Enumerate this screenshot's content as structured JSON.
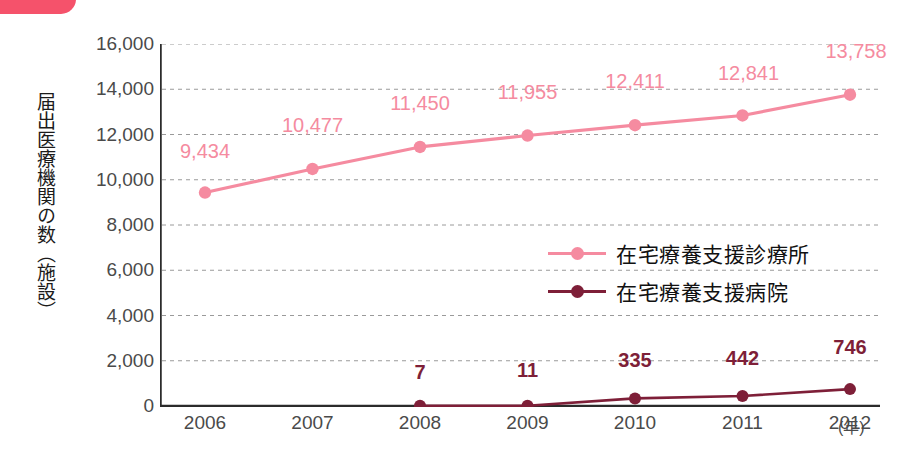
{
  "decoration": {
    "corner_tab_color": "#f5526b"
  },
  "axis": {
    "y_title": "届出医療機関の数（施設）",
    "x_unit": "(年)",
    "y_ticks": [
      "16,000",
      "14,000",
      "12,000",
      "10,000",
      "8,000",
      "6,000",
      "4,000",
      "2,000",
      "0"
    ],
    "x_ticks": [
      "2006",
      "2007",
      "2008",
      "2009",
      "2010",
      "2011",
      "2012"
    ]
  },
  "legend": {
    "position": "inside-right-middle",
    "items": [
      {
        "label": "在宅療養支援診療所",
        "color": "#f58ba0"
      },
      {
        "label": "在宅療養支援病院",
        "color": "#7e1f38"
      }
    ]
  },
  "chart_data": {
    "type": "line",
    "title": "",
    "xlabel": "(年)",
    "ylabel": "届出医療機関の数（施設）",
    "categories": [
      "2006",
      "2007",
      "2008",
      "2009",
      "2010",
      "2011",
      "2012"
    ],
    "ylim": [
      0,
      16000
    ],
    "ytick_step": 2000,
    "grid": true,
    "series": [
      {
        "name": "在宅療養支援診療所",
        "color": "#f58ba0",
        "values": [
          9434,
          10477,
          11450,
          11955,
          12411,
          12841,
          13758
        ],
        "labels": [
          "9,434",
          "10,477",
          "11,450",
          "11,955",
          "12,411",
          "12,841",
          "13,758"
        ]
      },
      {
        "name": "在宅療養支援病院",
        "color": "#7e1f38",
        "values": [
          null,
          null,
          7,
          11,
          335,
          442,
          746
        ],
        "labels": [
          null,
          null,
          "7",
          "11",
          "335",
          "442",
          "746"
        ]
      }
    ]
  }
}
